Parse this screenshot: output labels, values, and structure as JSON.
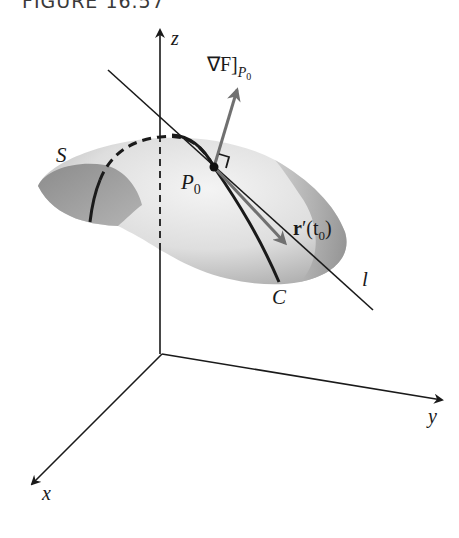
{
  "figure": {
    "title": "FIGURE 16.57"
  },
  "labels": {
    "z_axis": "z",
    "y_axis": "y",
    "x_axis": "x",
    "surface": "S",
    "point": "P",
    "point_sub": "0",
    "curve": "C",
    "line": "l",
    "gradient": "∇F]",
    "gradient_sub_P": "P",
    "gradient_sub_0": "0",
    "tangent_bold": "r",
    "tangent_rest": "′(t",
    "tangent_sub": "0",
    "tangent_close": ")"
  },
  "colors": {
    "surface_light": "#eeeeee",
    "surface_dark": "#9a9a9a",
    "axis": "#1a1a1a",
    "vector": "#6f6f6f",
    "curve": "#1a1a1a"
  }
}
